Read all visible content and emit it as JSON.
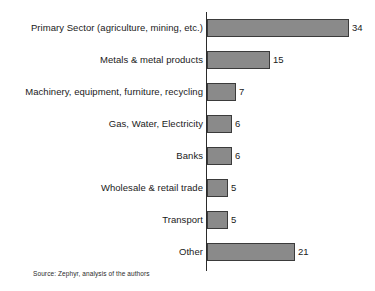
{
  "chart_data": {
    "type": "bar",
    "orientation": "horizontal",
    "title": "",
    "xlabel": "",
    "ylabel": "",
    "grid": false,
    "legend": null,
    "xlim": [
      0,
      34
    ],
    "categories": [
      "Primary Sector (agriculture, mining, etc.)",
      "Metals & metal products",
      "Machinery, equipment, furniture, recycling",
      "Gas, Water, Electricity",
      "Banks",
      "Wholesale & retail trade",
      "Transport",
      "Other"
    ],
    "values": [
      34,
      15,
      7,
      6,
      6,
      5,
      5,
      21
    ],
    "value_labels": [
      "34",
      "15",
      "7",
      "6",
      "6",
      "5",
      "5",
      "21"
    ],
    "bar_color": "#8a8a8a",
    "bar_border_color": "#3b3b3b",
    "axis_color": "#2b2b2b"
  },
  "source_note": "Source: Zephyr, analysis of the authors"
}
